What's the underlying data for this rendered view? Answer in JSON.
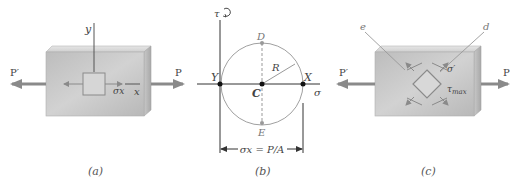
{
  "figure": {
    "panels": [
      {
        "id": "a",
        "caption": "(a)",
        "labels": {
          "force_left": "P′",
          "force_right": "P",
          "axis_y": "y",
          "axis_x": "x",
          "stress": "σx"
        }
      },
      {
        "id": "b",
        "caption": "(b)",
        "labels": {
          "tau_axis": "τ",
          "sigma_axis": "σ",
          "point_D": "D",
          "point_E": "E",
          "point_C": "C",
          "point_X": "X",
          "point_Y": "Y",
          "radius": "R",
          "dimension": "σx = P/A"
        }
      },
      {
        "id": "c",
        "caption": "(c)",
        "labels": {
          "force_left": "P′",
          "force_right": "P",
          "line_e": "e",
          "line_d": "d",
          "sigma_prime": "σ′",
          "tau_max": "τmax"
        }
      }
    ],
    "colors": {
      "block_front": "#c4c4c4",
      "block_top": "#dcdcdc",
      "block_side": "#b0b0b0",
      "arrow": "#8a8a8a",
      "circle": "#9a9a9a",
      "axis": "#555555",
      "point": "#111111"
    }
  }
}
